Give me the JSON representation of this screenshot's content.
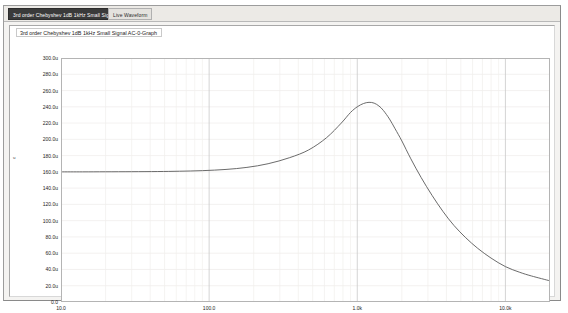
{
  "window": {
    "tabs": [
      {
        "label": "3rd order Chebyshev 1dB 1kHz Small Signal AC-0-Graph",
        "active": true
      },
      {
        "label": "Live Waveform",
        "active": false
      }
    ]
  },
  "graph": {
    "title": "3rd order Chebyshev 1dB 1kHz Small Signal AC-0-Graph"
  },
  "chart_data": {
    "type": "line",
    "title": "3rd order Chebyshev 1dB 1kHz Small Signal AC-0-Graph",
    "xlabel": "Freq",
    "ylabel": "",
    "y_unit": "u",
    "xscale": "log",
    "xlim": [
      10.0,
      20000.0
    ],
    "ylim": [
      0.0,
      300.0
    ],
    "grid": true,
    "legend": "none",
    "x_tick_labels": [
      "10.0",
      "100.0",
      "1.0k",
      "10.0k"
    ],
    "x_tick_values": [
      10,
      100,
      1000,
      10000
    ],
    "y_tick_labels": [
      "300.0u",
      "280.0u",
      "260.0u",
      "240.0u",
      "220.0u",
      "200.0u",
      "180.0u",
      "160.0u",
      "140.0u",
      "120.0u",
      "100.0u",
      "80.0u",
      "60.0u",
      "40.0u",
      "20.0u",
      "0.0"
    ],
    "y_tick_values": [
      300,
      280,
      260,
      240,
      220,
      200,
      180,
      160,
      140,
      120,
      100,
      80,
      60,
      40,
      20,
      0
    ],
    "series": [
      {
        "name": "V(out)",
        "color": "#5a5a5a",
        "x": [
          10,
          14,
          20,
          30,
          45,
          63,
          90,
          130,
          180,
          250,
          350,
          470,
          620,
          780,
          900,
          1000,
          1100,
          1200,
          1300,
          1400,
          1500,
          1650,
          1800,
          2000,
          2300,
          2700,
          3200,
          3800,
          4500,
          5400,
          6500,
          8000,
          10000,
          12500,
          15000,
          20000
        ],
        "y": [
          160.0,
          160.0,
          160.1,
          160.2,
          160.4,
          160.8,
          161.5,
          163.0,
          165.5,
          170.0,
          177.5,
          187.0,
          202.0,
          220.0,
          233.0,
          240.0,
          244.0,
          245.5,
          244.5,
          241.0,
          235.5,
          225.0,
          213.0,
          198.0,
          176.0,
          153.0,
          131.0,
          111.0,
          94.0,
          79.0,
          66.0,
          54.0,
          43.5,
          36.5,
          32.0,
          26.0
        ]
      }
    ]
  }
}
